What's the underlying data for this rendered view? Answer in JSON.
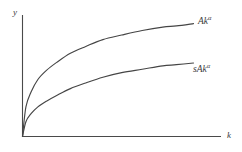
{
  "chart_data": {
    "type": "line",
    "title": "",
    "xlabel": "k",
    "ylabel": "y",
    "grid": false,
    "legend_position": "right-of-curve-ends",
    "axis_style": "two-axis-open-corner",
    "xlim": [
      0,
      1
    ],
    "ylim": [
      0,
      1
    ],
    "series": [
      {
        "name": "Ak^a",
        "label_base": "Ak",
        "label_exponent": "α",
        "description": "Production function, concave increasing curve from origin",
        "x": [
          0,
          0.02,
          0.05,
          0.09,
          0.14,
          0.2,
          0.28,
          0.37,
          0.47,
          0.58,
          0.7,
          0.82,
          0.9,
          1.0
        ],
        "y": [
          0,
          0.26,
          0.39,
          0.5,
          0.58,
          0.65,
          0.73,
          0.79,
          0.85,
          0.89,
          0.93,
          0.96,
          0.97,
          0.99
        ]
      },
      {
        "name": "sAk^a",
        "label_base": "sAk",
        "label_exponent": "α",
        "description": "Saving function, scaled-down concave curve from origin",
        "x": [
          0,
          0.02,
          0.05,
          0.09,
          0.14,
          0.2,
          0.28,
          0.37,
          0.47,
          0.58,
          0.7,
          0.82,
          0.9,
          1.0
        ],
        "y": [
          0,
          0.13,
          0.2,
          0.26,
          0.31,
          0.36,
          0.42,
          0.47,
          0.52,
          0.56,
          0.59,
          0.62,
          0.63,
          0.645
        ]
      }
    ]
  },
  "axes": {
    "y_label": "y",
    "x_label": "k"
  },
  "labels": {
    "upper_curve": {
      "base": "Ak",
      "exponent": "α"
    },
    "lower_curve": {
      "base": "sAk",
      "exponent": "α"
    }
  },
  "colors": {
    "line": "#454545",
    "axis": "#4a4a4a",
    "text": "#3b3b3b",
    "background": "#ffffff"
  }
}
